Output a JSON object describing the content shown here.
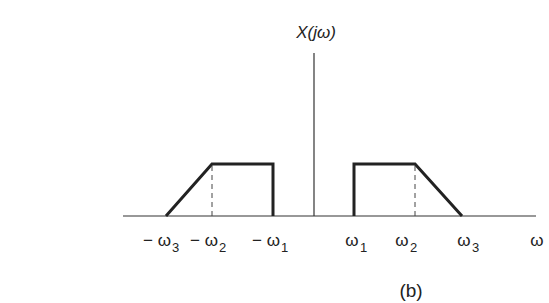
{
  "figure": {
    "y_axis_label": "X(jω)",
    "x_axis_label": "ω",
    "caption": "(b)",
    "ticks": [
      {
        "id": "neg_w3",
        "text": "− ω",
        "sub": "3",
        "x": 166
      },
      {
        "id": "neg_w2",
        "text": "− ω",
        "sub": "2",
        "x": 212
      },
      {
        "id": "neg_w1",
        "text": "− ω",
        "sub": "1",
        "x": 273
      },
      {
        "id": "w1",
        "text": "ω",
        "sub": "1",
        "x": 354
      },
      {
        "id": "w2",
        "text": "ω",
        "sub": "2",
        "x": 415
      },
      {
        "id": "w3",
        "text": "ω",
        "sub": "3",
        "x": 462
      }
    ],
    "colors": {
      "axis": "#333333",
      "spectrum": "#222222",
      "dashed": "#444444",
      "text": "#222222"
    }
  },
  "labels": {
    "neg_w3_main": "− ω",
    "neg_w3_sub": "3",
    "neg_w2_main": "− ω",
    "neg_w2_sub": "2",
    "neg_w1_main": "− ω",
    "neg_w1_sub": "1",
    "w1_main": "ω",
    "w1_sub": "1",
    "w2_main": "ω",
    "w2_sub": "2",
    "w3_main": "ω",
    "w3_sub": "3"
  }
}
